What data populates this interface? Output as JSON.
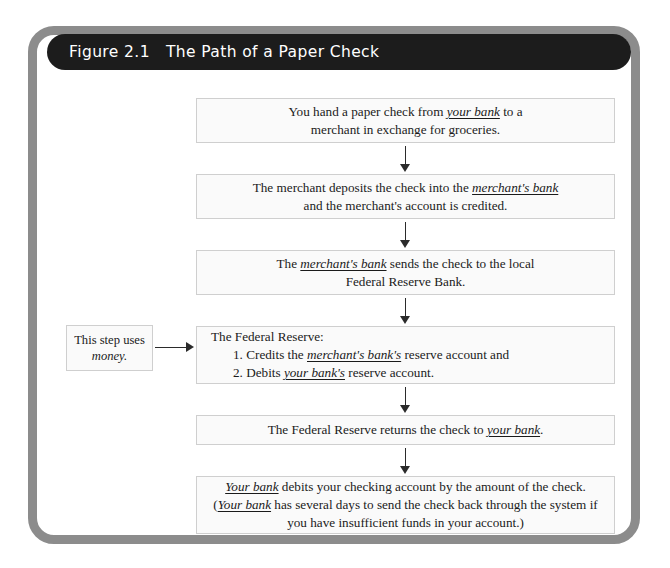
{
  "figure": {
    "label": "Figure 2.1",
    "title": "The Path of a Paper Check",
    "title_full": "Figure 2.1   The Path of a Paper Check"
  },
  "colors": {
    "frame": "#8c8c8c",
    "title_bar": "#1c1c1c",
    "title_text": "#ffffff",
    "box_fill": "#fafafa",
    "box_border": "#cfcfcf",
    "arrow": "#2b2b2b",
    "body_text": "#1a1a1a"
  },
  "callout": {
    "line1": "This step uses",
    "line2": "money."
  },
  "steps": [
    {
      "id": "step-1",
      "align": "center",
      "lines": [
        [
          {
            "t": "You hand a paper check from ",
            "style": "plain"
          },
          {
            "t": "your bank",
            "style": "term"
          },
          {
            "t": " to a",
            "style": "plain"
          }
        ],
        [
          {
            "t": "merchant in exchange for groceries.",
            "style": "plain"
          }
        ]
      ]
    },
    {
      "id": "step-2",
      "align": "center",
      "lines": [
        [
          {
            "t": "The merchant deposits the check into the ",
            "style": "plain"
          },
          {
            "t": "merchant's bank",
            "style": "term"
          }
        ],
        [
          {
            "t": "and the merchant's account is credited.",
            "style": "plain"
          }
        ]
      ]
    },
    {
      "id": "step-3",
      "align": "center",
      "lines": [
        [
          {
            "t": "The ",
            "style": "plain"
          },
          {
            "t": "merchant's bank",
            "style": "term"
          },
          {
            "t": " sends the check to the local",
            "style": "plain"
          }
        ],
        [
          {
            "t": "Federal Reserve Bank.",
            "style": "plain"
          }
        ]
      ]
    },
    {
      "id": "step-4",
      "align": "left",
      "lines": [
        [
          {
            "t": "The Federal Reserve:",
            "style": "plain"
          }
        ],
        [
          {
            "t": "1. Credits the ",
            "style": "plain",
            "indent": true
          },
          {
            "t": "merchant's bank's",
            "style": "term"
          },
          {
            "t": " reserve account and",
            "style": "plain"
          }
        ],
        [
          {
            "t": "2. Debits ",
            "style": "plain",
            "indent": true
          },
          {
            "t": "your bank's",
            "style": "term"
          },
          {
            "t": " reserve account.",
            "style": "plain"
          }
        ]
      ]
    },
    {
      "id": "step-5",
      "align": "center",
      "lines": [
        [
          {
            "t": "The Federal Reserve returns the check to ",
            "style": "plain"
          },
          {
            "t": "your bank",
            "style": "term"
          },
          {
            "t": ".",
            "style": "plain"
          }
        ]
      ]
    },
    {
      "id": "step-6",
      "align": "center",
      "lines": [
        [
          {
            "t": "Your bank",
            "style": "term"
          },
          {
            "t": " debits your checking account by the amount of the check.",
            "style": "plain"
          }
        ],
        [
          {
            "t": "(",
            "style": "plain"
          },
          {
            "t": "Your bank",
            "style": "term"
          },
          {
            "t": " has several days to send the check back through the system if",
            "style": "plain"
          }
        ],
        [
          {
            "t": "you have insufficient funds in your account.)",
            "style": "plain"
          }
        ]
      ]
    }
  ]
}
